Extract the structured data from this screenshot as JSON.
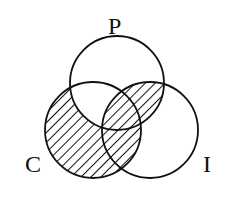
{
  "diagram": {
    "type": "venn",
    "sets": [
      {
        "id": "P",
        "label": "P",
        "cx": 117,
        "cy": 83,
        "r": 47
      },
      {
        "id": "C",
        "label": "C",
        "cx": 93,
        "cy": 130,
        "r": 48
      },
      {
        "id": "I",
        "label": "I",
        "cx": 150,
        "cy": 130,
        "r": 48
      }
    ],
    "shaded_regions": [
      "C only",
      "C∩I not P",
      "P∩I not C",
      "P∩C∩I"
    ],
    "unshaded_regions": [
      "P only",
      "I only",
      "P∩C not I"
    ],
    "labels": {
      "P": "P",
      "C": "C",
      "I": "I"
    },
    "colors": {
      "stroke": "#111111",
      "hatch": "#111111",
      "background": "#ffffff"
    }
  }
}
